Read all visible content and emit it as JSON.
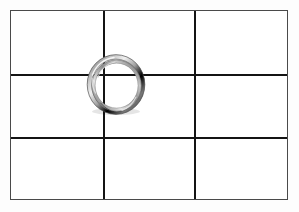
{
  "scene": {
    "title": "Metal split ring resting on a three-by-three grid",
    "background_color": "#fdfdfd"
  },
  "grid_panel": {
    "name": "grid-panel",
    "frame_color": "#4a4a4a",
    "line_color": "#141414",
    "fill_color": "#ffffff",
    "columns": 3,
    "rows": 3,
    "cells": [
      {
        "id": "cell-r1c1",
        "row": 1,
        "column": 1
      },
      {
        "id": "cell-r1c2",
        "row": 1,
        "column": 2
      },
      {
        "id": "cell-r1c3",
        "row": 1,
        "column": 3
      },
      {
        "id": "cell-r2c1",
        "row": 2,
        "column": 1
      },
      {
        "id": "cell-r2c2",
        "row": 2,
        "column": 2
      },
      {
        "id": "cell-r2c3",
        "row": 2,
        "column": 3
      },
      {
        "id": "cell-r3c1",
        "row": 3,
        "column": 1
      },
      {
        "id": "cell-r3c2",
        "row": 3,
        "column": 2
      },
      {
        "id": "cell-r3c3",
        "row": 3,
        "column": 3
      }
    ],
    "lines": [
      {
        "id": "grid-line-v1",
        "orientation": "vertical",
        "offset_px": 92
      },
      {
        "id": "grid-line-v2",
        "orientation": "vertical",
        "offset_px": 183
      },
      {
        "id": "grid-line-h1",
        "orientation": "horizontal",
        "offset_px": 63
      },
      {
        "id": "grid-line-h2",
        "orientation": "horizontal",
        "offset_px": 126
      }
    ]
  },
  "ring": {
    "name": "split-ring",
    "material": "brushed metal",
    "shape": "split ring",
    "highlight_color": "#f2f2f2",
    "midtone_color": "#9a9a9a",
    "shadow_color": "#3c3c3c",
    "outer_width_px": 60,
    "outer_height_px": 63,
    "wire_thickness_px": 5,
    "position_note": "centered on the upper-left interior grid intersection"
  }
}
